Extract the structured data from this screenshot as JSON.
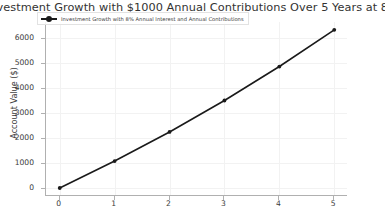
{
  "chart_data": {
    "type": "line",
    "title": "Investment Growth with $1000 Annual Contributions Over 5 Years at 8% Annual Interest",
    "xlabel": "",
    "ylabel": "Account Value ($)",
    "x": [
      0,
      1,
      2,
      3,
      4,
      5
    ],
    "xticklabels": [
      "0",
      "1",
      "2",
      "3",
      "4",
      "5"
    ],
    "yticks": [
      0,
      1000,
      2000,
      3000,
      4000,
      5000,
      6000
    ],
    "yticklabels": [
      "0",
      "1000",
      "2000",
      "3000",
      "4000",
      "5000",
      "6000"
    ],
    "xlim": [
      -0.25,
      5.25
    ],
    "ylim": [
      -320,
      6650
    ],
    "grid": true,
    "legend_position": "upper left",
    "series": [
      {
        "name": "Investment Growth with 8% Annual Interest and Annual Contributions",
        "values": [
          0,
          1080,
          2246,
          3506,
          4866,
          6336
        ],
        "color": "#1a1a1a",
        "marker": "o",
        "linewidth": 1.6
      }
    ]
  },
  "figure": {
    "background": "#ffffff",
    "axes_color": "#b0b0b0",
    "grid_color": "#f2f2f2",
    "tick_label_color": "#3b3b3b"
  }
}
